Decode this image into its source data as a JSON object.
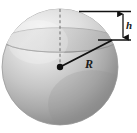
{
  "figure": {
    "name": "sphere-with-spherical-cap",
    "background_color": "#ffffff",
    "labels": [
      {
        "id": "h",
        "text": "h",
        "meaning": "cap-height",
        "style": "italic-serif",
        "color": "#1a1a1a"
      },
      {
        "id": "R",
        "text": "R",
        "meaning": "sphere-radius",
        "style": "italic-serif",
        "color": "#1a1a1a"
      }
    ],
    "colors": {
      "sphere_highlight": "#ececec",
      "sphere_midtone": "#bdbdbd",
      "sphere_shadow": "#8d8d8d",
      "cap_band_light": "#d6d6d6",
      "outline": "#9a9a9a",
      "line": "#1a1a1a",
      "dashed_axis": "#6e6e6e",
      "center_dot": "#111111"
    },
    "geometry": {
      "sphere_center": {
        "x": 60,
        "y": 67
      },
      "sphere_radius_px": 58,
      "cap_plane_y": 40,
      "sphere_top_y": 9,
      "cap_height_px": 31,
      "radius_line_end": {
        "x": 111,
        "y": 41
      },
      "dimension_line_x": 123,
      "leader_top_y": 12,
      "leader_bottom_y": 40,
      "leader_left_x": 79,
      "leader_right_x": 131
    },
    "elements": {
      "sphere_body": "sphere-body",
      "cap_section": "spherical-cap-section",
      "cap_ellipse": "cap-cutting-plane-ellipse",
      "equator_ellipse": "equator-ellipse",
      "radius_line": "radius-line",
      "center_dot": "center-point-dot",
      "vertical_axis": "vertical-dashed-axis",
      "dimension_arrow": "cap-height-dimension-arrow",
      "leader_top": "upper-leader-line",
      "leader_bottom": "lower-leader-line"
    }
  }
}
